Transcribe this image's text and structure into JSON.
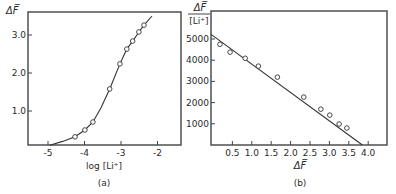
{
  "figure": {
    "panels": [
      {
        "id": "a",
        "caption": "(a)",
        "xlabel": "log [Li⁺]",
        "ylabel": "ΔF̅",
        "xticks": [
          "-5",
          "-4",
          "-3",
          "-2"
        ],
        "yticks": [
          "1.0",
          "2.0",
          "3.0"
        ]
      },
      {
        "id": "b",
        "caption": "(b)",
        "xlabel": "ΔF̅",
        "ylabel_num": "ΔF̅",
        "ylabel_den": "[Li⁺]",
        "xticks": [
          "0.5",
          "1.0",
          "1.5",
          "2.0",
          "2.5",
          "3.0",
          "3.5",
          "4.0"
        ],
        "yticks": [
          "1000",
          "2000",
          "3000",
          "4000",
          "5000"
        ]
      }
    ]
  },
  "chart_data": [
    {
      "type": "line",
      "panel": "(a)",
      "title": "",
      "xlabel": "log [Li+]",
      "ylabel": "ΔF",
      "xlim": [
        -5.55,
        -1.35
      ],
      "ylim": [
        0,
        3.55
      ],
      "xticks": [
        -5,
        -4,
        -3,
        -2
      ],
      "yticks": [
        1.0,
        2.0,
        3.0
      ],
      "grid": false,
      "series": [
        {
          "name": "measured (points)",
          "x": [
            -4.26,
            -3.99,
            -3.77,
            -3.31,
            -3.03,
            -2.84,
            -2.68,
            -2.51,
            -2.37
          ],
          "y": [
            0.32,
            0.5,
            0.71,
            1.58,
            2.24,
            2.63,
            2.84,
            3.08,
            3.26
          ]
        },
        {
          "name": "fitted curve",
          "x": [
            -4.95,
            -4.6,
            -4.26,
            -3.99,
            -3.77,
            -3.55,
            -3.31,
            -3.03,
            -2.84,
            -2.68,
            -2.51,
            -2.37,
            -2.15
          ],
          "y": [
            0.1,
            0.2,
            0.32,
            0.5,
            0.71,
            1.08,
            1.58,
            2.24,
            2.63,
            2.84,
            3.08,
            3.26,
            3.5
          ]
        }
      ]
    },
    {
      "type": "scatter",
      "panel": "(b)",
      "title": "",
      "xlabel": "ΔF",
      "ylabel": "ΔF / [Li+]",
      "xlim": [
        0,
        4.3
      ],
      "ylim": [
        0,
        5600
      ],
      "xticks": [
        0.5,
        1.0,
        1.5,
        2.0,
        2.5,
        3.0,
        3.5,
        4.0
      ],
      "yticks": [
        1000,
        2000,
        3000,
        4000,
        5000
      ],
      "grid": false,
      "series": [
        {
          "name": "measured (points)",
          "x": [
            0.18,
            0.44,
            0.83,
            1.17,
            1.66,
            2.34,
            2.78,
            3.01,
            3.25,
            3.45
          ],
          "y": [
            4750,
            4380,
            4090,
            3720,
            3200,
            2260,
            1690,
            1410,
            990,
            800
          ]
        },
        {
          "name": "linear fit",
          "x": [
            -0.05,
            3.85
          ],
          "y": [
            5220,
            0
          ]
        }
      ]
    }
  ]
}
